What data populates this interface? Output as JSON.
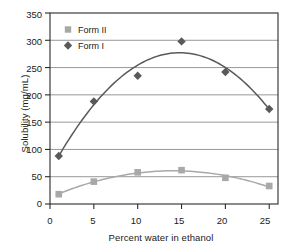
{
  "chart_data": {
    "type": "scatter",
    "title": "",
    "xlabel": "Percent water in ethanol",
    "ylabel": "Solubility (mg/mL)",
    "xlim": [
      0,
      26
    ],
    "ylim": [
      0,
      350
    ],
    "xticks": [
      "0",
      "5",
      "10",
      "15",
      "20",
      "25"
    ],
    "xtick_values": [
      0,
      5,
      10,
      15,
      20,
      25
    ],
    "yticks": [
      "0",
      "50",
      "100",
      "150",
      "200",
      "250",
      "300",
      "350"
    ],
    "ytick_values": [
      0,
      50,
      100,
      150,
      200,
      250,
      300,
      350
    ],
    "grid": "horizontal",
    "legend_position": "top-left",
    "x": [
      1,
      5,
      10,
      15,
      20,
      25
    ],
    "series": [
      {
        "name": "Form I",
        "marker": "diamond",
        "color": "#595959",
        "values": [
          88,
          188,
          235,
          298,
          242,
          174
        ],
        "fit": "quadratic"
      },
      {
        "name": "Form II",
        "marker": "square",
        "color": "#a8a8a8",
        "values": [
          18,
          41,
          58,
          62,
          48,
          33
        ],
        "fit": "quadratic"
      }
    ]
  },
  "legend": {
    "entries": [
      {
        "label": "Form II",
        "marker": "square-marker",
        "color": "#a8a8a8"
      },
      {
        "label": "Form I",
        "marker": "diamond-marker",
        "color": "#595959"
      }
    ]
  },
  "axes": {
    "y_title": "Solubility (mg/mL)",
    "x_title": "Percent water in ethanol",
    "y_labels": [
      "350",
      "300",
      "250",
      "200",
      "150",
      "100",
      "50",
      "0"
    ],
    "x_labels": [
      "0",
      "5",
      "10",
      "15",
      "20",
      "25"
    ]
  },
  "colors": {
    "form_i": "#595959",
    "form_ii": "#a8a8a8",
    "grid": "#8c8c8c",
    "frame": "#2b2b2b",
    "background": "#ffffff"
  }
}
